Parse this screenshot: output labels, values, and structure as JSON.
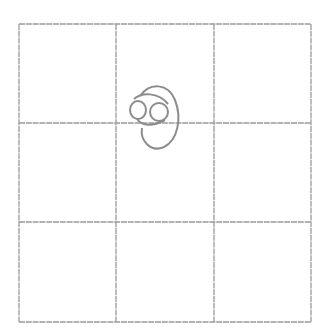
{
  "board": {
    "rows": 3,
    "cols": 3,
    "line_color": "#9a9a9a",
    "mark_color": "#8c8c8c",
    "x_lines": [
      19,
      116,
      214,
      311
    ],
    "y_lines": [
      24,
      123,
      222,
      322
    ],
    "cells": [
      {
        "row": 0,
        "col": 0,
        "mark": ""
      },
      {
        "row": 0,
        "col": 1,
        "mark": "doodle"
      },
      {
        "row": 0,
        "col": 2,
        "mark": ""
      },
      {
        "row": 1,
        "col": 0,
        "mark": ""
      },
      {
        "row": 1,
        "col": 1,
        "mark": "doodle"
      },
      {
        "row": 1,
        "col": 2,
        "mark": ""
      },
      {
        "row": 2,
        "col": 0,
        "mark": ""
      },
      {
        "row": 2,
        "col": 1,
        "mark": ""
      },
      {
        "row": 2,
        "col": 2,
        "mark": ""
      }
    ]
  },
  "doodle": {
    "description": "hand-drawn figure with two small circles (eyes) and an oval outline, straddling the line between the top-middle and center cells",
    "icon": "face-doodle-icon"
  }
}
